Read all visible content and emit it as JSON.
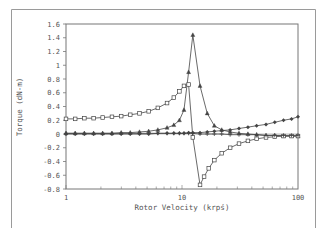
{
  "chart_data": {
    "type": "line",
    "title": "",
    "xlabel": "Rotor Velocity (krpś)",
    "ylabel": "Torque (dN-m)",
    "xscale": "log",
    "xlim": [
      1,
      100
    ],
    "ylim": [
      -0.8,
      1.6
    ],
    "x_ticks": [
      1,
      10,
      100
    ],
    "x_tick_labels": [
      "1",
      "10",
      "100"
    ],
    "y_ticks": [
      1.6,
      1.4,
      1.2,
      1,
      0.8,
      0.6,
      0.4,
      0.2,
      0,
      -0.2,
      -0.4,
      -0.6,
      -0.8
    ],
    "y_tick_labels": [
      "1.6",
      "1.4",
      "1.2",
      "1",
      "0.8",
      "0.6",
      "0.4",
      "0.2",
      "0",
      "-0.2",
      "-0.4",
      "-0.6",
      "-0.8"
    ],
    "grid": false,
    "legend": null,
    "series": [
      {
        "name": "triangle-series",
        "marker": "triangle",
        "x": [
          1,
          1.2,
          1.44,
          1.73,
          2.07,
          2.49,
          2.99,
          3.58,
          4.3,
          5.16,
          6.19,
          7.43,
          8.5,
          9.5,
          10.4,
          11.4,
          12.4,
          14.3,
          16.5,
          19,
          22,
          26,
          31,
          37,
          44,
          53,
          63,
          75,
          88,
          100
        ],
        "y": [
          0.01,
          0.01,
          0.01,
          0.01,
          0.01,
          0.01,
          0.02,
          0.02,
          0.03,
          0.04,
          0.06,
          0.09,
          0.13,
          0.2,
          0.35,
          0.9,
          1.44,
          0.7,
          0.3,
          0.12,
          0.06,
          0.03,
          0.01,
          0,
          -0.01,
          -0.02,
          -0.02,
          -0.03,
          -0.03,
          -0.03
        ]
      },
      {
        "name": "square-series",
        "marker": "square",
        "x": [
          1,
          1.2,
          1.44,
          1.73,
          2.07,
          2.49,
          2.99,
          3.58,
          4.3,
          5.16,
          6.19,
          7.43,
          8.5,
          9.5,
          10.4,
          11.4,
          12.4,
          14.3,
          15.5,
          17,
          19,
          22,
          26,
          31,
          37,
          44,
          53,
          63,
          75,
          88,
          100
        ],
        "y": [
          0.22,
          0.22,
          0.23,
          0.23,
          0.24,
          0.25,
          0.26,
          0.28,
          0.3,
          0.33,
          0.38,
          0.45,
          0.53,
          0.62,
          0.7,
          0.72,
          -0.05,
          -0.74,
          -0.62,
          -0.5,
          -0.38,
          -0.28,
          -0.2,
          -0.14,
          -0.1,
          -0.07,
          -0.05,
          -0.04,
          -0.03,
          -0.03,
          -0.03
        ]
      },
      {
        "name": "diamond-series",
        "marker": "diamond",
        "x": [
          1,
          1.2,
          1.44,
          1.73,
          2.07,
          2.49,
          2.99,
          3.58,
          4.3,
          5.16,
          6.19,
          7.43,
          8.5,
          9.5,
          10.4,
          11.4,
          12.4,
          14.3,
          16.5,
          19,
          22,
          26,
          31,
          37,
          44,
          53,
          63,
          75,
          88,
          100
        ],
        "y": [
          0.0,
          0.0,
          0.0,
          0.0,
          0.0,
          0.0,
          0.0,
          0.0,
          0.0,
          0.0,
          0.01,
          0.01,
          0.01,
          0.01,
          0.01,
          0.02,
          0.02,
          0.02,
          0.03,
          0.04,
          0.05,
          0.06,
          0.08,
          0.1,
          0.12,
          0.14,
          0.17,
          0.2,
          0.22,
          0.25
        ]
      },
      {
        "name": "cross-series",
        "marker": "plus",
        "x": [
          1,
          1.2,
          1.44,
          1.73,
          2.07,
          2.49,
          2.99,
          3.58,
          4.3,
          5.16,
          6.19,
          7.43,
          8.5,
          9.5,
          10.4,
          11.4,
          12.4,
          14.3,
          16.5,
          19,
          22,
          26,
          31,
          37,
          44,
          53,
          63,
          75,
          88,
          100
        ],
        "y": [
          0.01,
          0.01,
          0.01,
          0.01,
          0.01,
          0.01,
          0.01,
          0.01,
          0.01,
          0.01,
          0.01,
          0.01,
          0.01,
          0.01,
          0.01,
          0.01,
          0.01,
          0.0,
          0.0,
          0.0,
          0.0,
          -0.01,
          -0.01,
          -0.01,
          -0.01,
          -0.02,
          -0.02,
          -0.02,
          -0.02,
          -0.02
        ]
      }
    ]
  },
  "frame": {
    "line_color": "#9a9a9a",
    "axis_color": "#666666",
    "series_color": "#444444"
  }
}
